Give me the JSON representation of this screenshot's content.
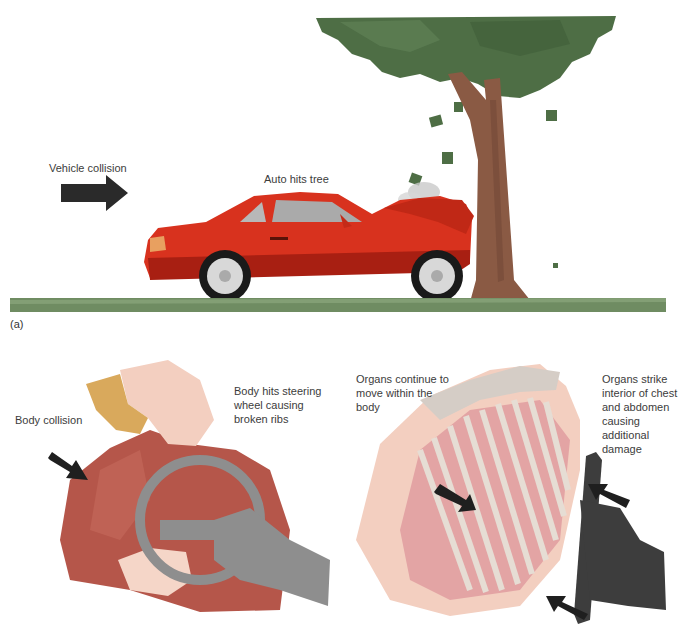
{
  "figure": {
    "panel_a": {
      "tag": "(a)",
      "labels": {
        "vehicle_collision": "Vehicle collision",
        "auto_hits_tree": "Auto hits tree"
      }
    },
    "panel_b": {
      "labels": {
        "body_collision": "Body collision",
        "body_hits_wheel": [
          "Body hits steering",
          "wheel causing",
          "broken ribs"
        ],
        "organs_continue": [
          "Organs continue to",
          "move within the",
          "body"
        ],
        "organs_strike": [
          "Organs strike",
          "interior of chest",
          "and abdomen",
          "causing",
          "additional",
          "damage"
        ]
      }
    },
    "colors": {
      "car_red": "#d8321e",
      "tree_green": "#4e6e45",
      "trunk_brown": "#8a5a44",
      "grass_green": "#6f8c62",
      "shirt_red": "#b5564a",
      "skin": "#f3cfc0",
      "hair": "#d9a95c",
      "wheel_gray": "#8e8e8e",
      "column_dark": "#3d3d3d",
      "rib_pink": "#e3a4a4",
      "arrow": "#1f1f1f"
    }
  }
}
